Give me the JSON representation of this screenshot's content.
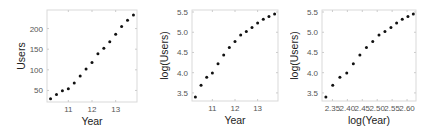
{
  "chart_data": [
    {
      "type": "scatter",
      "title": "",
      "xlabel": "Year",
      "ylabel": "Users",
      "xlim": [
        10.1,
        13.9
      ],
      "ylim": [
        22,
        245
      ],
      "x_ticks": [
        11,
        12,
        13
      ],
      "x_tick_labels": [
        "11",
        "12",
        "13"
      ],
      "y_ticks": [
        50,
        100,
        150,
        200
      ],
      "y_tick_labels": [
        "50",
        "100",
        "150",
        "200"
      ],
      "grid": false,
      "x": [
        10.25,
        10.5,
        10.75,
        11.0,
        11.25,
        11.5,
        11.75,
        12.0,
        12.25,
        12.5,
        12.75,
        13.0,
        13.25,
        13.5,
        13.75
      ],
      "y": [
        30,
        40,
        49,
        54,
        68,
        85,
        102,
        118,
        139,
        152,
        168,
        186,
        205,
        220,
        233
      ]
    },
    {
      "type": "scatter",
      "title": "",
      "xlabel": "Year",
      "ylabel": "log(Users)",
      "xlim": [
        10.1,
        13.9
      ],
      "ylim": [
        3.3,
        5.55
      ],
      "x_ticks": [
        11,
        12,
        13
      ],
      "x_tick_labels": [
        "11",
        "12",
        "13"
      ],
      "y_ticks": [
        3.5,
        4.0,
        4.5,
        5.0,
        5.5
      ],
      "y_tick_labels": [
        "3.5",
        "4.0",
        "4.5",
        "5.0",
        "5.5"
      ],
      "grid": false,
      "x": [
        10.25,
        10.5,
        10.75,
        11.0,
        11.25,
        11.5,
        11.75,
        12.0,
        12.25,
        12.5,
        12.75,
        13.0,
        13.25,
        13.5,
        13.75
      ],
      "y": [
        3.4,
        3.69,
        3.89,
        3.99,
        4.22,
        4.44,
        4.62,
        4.77,
        4.93,
        5.02,
        5.12,
        5.23,
        5.32,
        5.39,
        5.45
      ]
    },
    {
      "type": "scatter",
      "title": "",
      "xlabel": "log(Year)",
      "ylabel": "log(Users)",
      "xlim": [
        2.315,
        2.63
      ],
      "ylim": [
        3.3,
        5.55
      ],
      "x_ticks": [
        2.35,
        2.4,
        2.45,
        2.5,
        2.55,
        2.6
      ],
      "x_tick_labels": [
        "2.35",
        "2.40",
        "2.45",
        "2.50",
        "2.55",
        "2.60"
      ],
      "y_ticks": [
        3.5,
        4.0,
        4.5,
        5.0,
        5.5
      ],
      "y_tick_labels": [
        "3.5",
        "4.0",
        "4.5",
        "5.0",
        "5.5"
      ],
      "grid": false,
      "x": [
        2.328,
        2.351,
        2.375,
        2.398,
        2.42,
        2.442,
        2.464,
        2.485,
        2.506,
        2.526,
        2.546,
        2.565,
        2.584,
        2.603,
        2.621
      ],
      "y": [
        3.4,
        3.69,
        3.89,
        3.99,
        4.22,
        4.44,
        4.62,
        4.77,
        4.93,
        5.02,
        5.12,
        5.23,
        5.32,
        5.39,
        5.45
      ]
    }
  ],
  "layout": {
    "panels": [
      {
        "left": 0,
        "width": 145,
        "plot": {
          "x0": 47,
          "y0": 10,
          "x1": 137,
          "y1": 102
        }
      },
      {
        "left": 145,
        "width": 145,
        "plot": {
          "x0": 47,
          "y0": 10,
          "x1": 133,
          "y1": 101
        }
      },
      {
        "left": 290,
        "width": 145,
        "plot": {
          "x0": 32,
          "y0": 10,
          "x1": 126,
          "y1": 101
        }
      }
    ],
    "frame_color": "#d9d9d9",
    "point_color": "#111111",
    "point_radius": 1.5
  }
}
